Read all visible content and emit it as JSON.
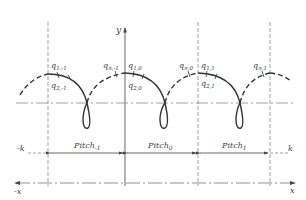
{
  "diagram": {
    "axes": {
      "y_label": "y",
      "x_label": "x",
      "neg_x_label": "-x",
      "k_label": "k",
      "neg_k_label": "-k"
    },
    "points": [
      {
        "label": "q",
        "sub": "1,-1"
      },
      {
        "label": "q",
        "sub": "2,-1"
      },
      {
        "label": "q",
        "sub": "n,-1"
      },
      {
        "label": "q",
        "sub": "1,0"
      },
      {
        "label": "q",
        "sub": "2,0"
      },
      {
        "label": "q",
        "sub": "n,0"
      },
      {
        "label": "q",
        "sub": "1,1"
      },
      {
        "label": "q",
        "sub": "2,1"
      },
      {
        "label": "q",
        "sub": "n,1"
      }
    ],
    "pitches": [
      {
        "label": "Pitch",
        "sub": "-1"
      },
      {
        "label": "Pitch",
        "sub": "0"
      },
      {
        "label": "Pitch",
        "sub": "1"
      }
    ],
    "colors": {
      "line": "#555555",
      "curve": "#333333"
    }
  }
}
